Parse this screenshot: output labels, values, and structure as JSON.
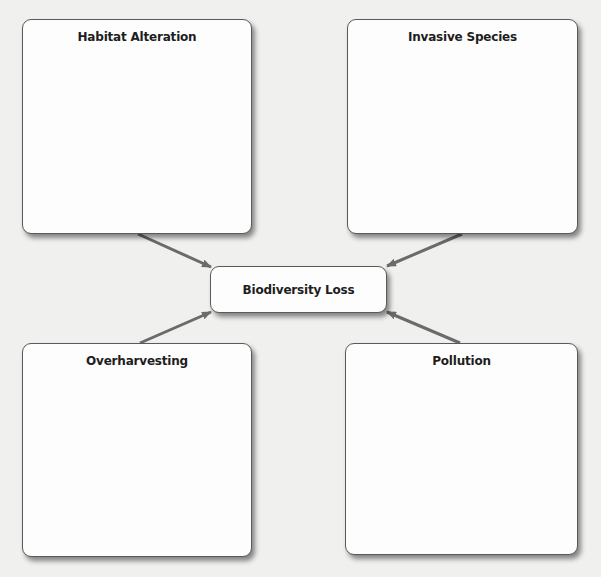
{
  "diagram": {
    "center": {
      "label": "Biodiversity Loss"
    },
    "causes": [
      {
        "label": "Habitat Alteration",
        "position": "top-left"
      },
      {
        "label": "Invasive Species",
        "position": "top-right"
      },
      {
        "label": "Overharvesting",
        "position": "bottom-left"
      },
      {
        "label": "Pollution",
        "position": "bottom-right"
      }
    ],
    "colors": {
      "background": "#f0f0ef",
      "box_fill": "#fdfdfd",
      "box_border": "#5a5a5a",
      "arrow": "#6b6b6b",
      "text": "#1e1e1e"
    }
  }
}
